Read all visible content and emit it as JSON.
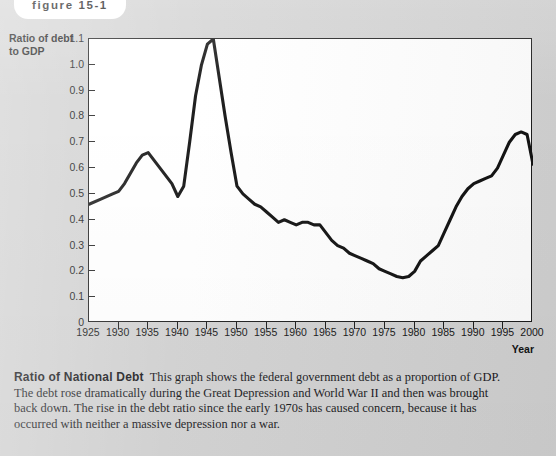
{
  "figure": {
    "tab_label": "figure 15-1"
  },
  "caption": {
    "lead": "Ratio of National Debt",
    "body": "This graph shows the federal government debt as a proportion of GDP. The debt rose dramatically during the Great Depression and World War II and then was brought back down. The rise in the debt ratio since the early 1970s has caused concern, because it has occurred with neither a massive depression nor a war."
  },
  "colors": {
    "page_background": "#d2d2d2",
    "plot_background": "#ffffff",
    "axis": "#1b1b1b",
    "line": "#111111",
    "text": "#151515"
  },
  "chart_data": {
    "type": "line",
    "title": "",
    "xlabel": "Year",
    "ylabel": "Ratio of debt to GDP",
    "ylabel_line1": "Ratio of debt",
    "ylabel_line2": "to GDP",
    "xlim": [
      1925,
      2000
    ],
    "ylim": [
      0,
      1.1
    ],
    "grid": false,
    "legend": null,
    "ytick_labels": [
      "0",
      "0.1",
      "0.2",
      "0.3",
      "0.4",
      "0.5",
      "0.6",
      "0.7",
      "0.8",
      "0.9",
      "1.0",
      "1.1"
    ],
    "yticks": [
      0,
      0.1,
      0.2,
      0.3,
      0.4,
      0.5,
      0.6,
      0.7,
      0.8,
      0.9,
      1.0,
      1.1
    ],
    "xtick_labels": [
      "1925",
      "1930",
      "1935",
      "1940",
      "1945",
      "1950",
      "1955",
      "1960",
      "1965",
      "1970",
      "1975",
      "1980",
      "1985",
      "1990",
      "1995",
      "2000"
    ],
    "xticks": [
      1925,
      1930,
      1935,
      1940,
      1945,
      1950,
      1955,
      1960,
      1965,
      1970,
      1975,
      1980,
      1985,
      1990,
      1995,
      2000
    ],
    "series": [
      {
        "name": "Ratio of debt to GDP",
        "x": [
          1925,
          1927,
          1929,
          1930,
          1931,
          1932,
          1933,
          1934,
          1935,
          1936,
          1937,
          1938,
          1939,
          1940,
          1941,
          1942,
          1943,
          1944,
          1945,
          1946,
          1947,
          1948,
          1949,
          1950,
          1951,
          1952,
          1953,
          1954,
          1955,
          1956,
          1957,
          1958,
          1959,
          1960,
          1961,
          1962,
          1963,
          1964,
          1965,
          1966,
          1967,
          1968,
          1969,
          1970,
          1971,
          1972,
          1973,
          1974,
          1975,
          1976,
          1977,
          1978,
          1979,
          1980,
          1981,
          1982,
          1983,
          1984,
          1985,
          1986,
          1987,
          1988,
          1989,
          1990,
          1991,
          1992,
          1993,
          1994,
          1995,
          1996,
          1997,
          1998,
          1999,
          2000
        ],
        "y": [
          0.46,
          0.48,
          0.5,
          0.51,
          0.54,
          0.58,
          0.62,
          0.65,
          0.66,
          0.63,
          0.6,
          0.57,
          0.54,
          0.49,
          0.53,
          0.7,
          0.88,
          1.0,
          1.08,
          1.1,
          0.95,
          0.8,
          0.66,
          0.53,
          0.5,
          0.48,
          0.46,
          0.45,
          0.43,
          0.41,
          0.39,
          0.4,
          0.39,
          0.38,
          0.39,
          0.39,
          0.38,
          0.38,
          0.35,
          0.32,
          0.3,
          0.29,
          0.27,
          0.26,
          0.25,
          0.24,
          0.23,
          0.21,
          0.2,
          0.19,
          0.18,
          0.175,
          0.18,
          0.2,
          0.24,
          0.26,
          0.28,
          0.3,
          0.35,
          0.4,
          0.45,
          0.49,
          0.52,
          0.54,
          0.55,
          0.56,
          0.57,
          0.6,
          0.65,
          0.7,
          0.73,
          0.74,
          0.73,
          0.615
        ]
      }
    ]
  }
}
